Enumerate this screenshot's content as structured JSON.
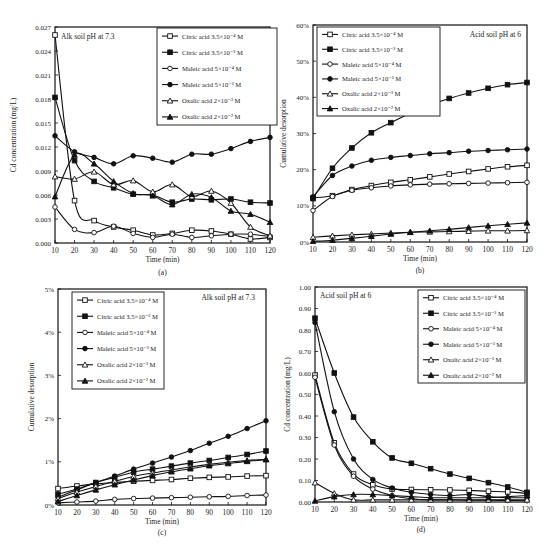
{
  "figure": {
    "panel_labels": [
      "(a)",
      "(b)",
      "(c)",
      "(d)"
    ]
  },
  "legend_entries": [
    {
      "label": "Citric acid 3.5×10⁻⁴ M",
      "marker": "square",
      "fill": "open"
    },
    {
      "label": "Citric acid 3.5×10⁻³ M",
      "marker": "square",
      "fill": "filled"
    },
    {
      "label": "Maleic acid 5×10⁻⁴ M",
      "marker": "circle",
      "fill": "open"
    },
    {
      "label": "Maleic acid 5×10⁻³ M",
      "marker": "circle",
      "fill": "filled"
    },
    {
      "label": "Oxalic acid 2×10⁻³ M",
      "marker": "triangle",
      "fill": "open"
    },
    {
      "label": "Oxalic acid 2×10⁻² M",
      "marker": "triangle",
      "fill": "filled"
    }
  ],
  "chart_data": [
    {
      "id": "a",
      "type": "line",
      "title": "Alk soil pH at 7.3",
      "panel_label": "(a)",
      "xlabel": "Time (min)",
      "ylabel": "Cd concentration (mg/L)",
      "x": [
        10,
        20,
        30,
        40,
        50,
        60,
        70,
        80,
        90,
        100,
        110,
        120
      ],
      "xlim": [
        10,
        120
      ],
      "ylim": [
        0,
        0.027
      ],
      "yticks": [
        0.0,
        0.003,
        0.006,
        0.009,
        0.012,
        0.015,
        0.018,
        0.021,
        0.024,
        0.027
      ],
      "ytick_labels": [
        "0.000",
        "0.003",
        "0.006",
        "0.009",
        "0.012",
        "0.015",
        "0.018",
        "0.021",
        "0.024",
        "0.027"
      ],
      "legend_position": "upper right",
      "grid": false,
      "series": [
        {
          "name": "Citric acid 3.5×10⁻⁴ M",
          "values": [
            0.026,
            0.0053,
            0.0028,
            0.002,
            0.0016,
            0.001,
            0.0012,
            0.0016,
            0.0015,
            0.0011,
            0.0005,
            0.0007
          ]
        },
        {
          "name": "Citric acid 3.5×10⁻³ M",
          "values": [
            0.0182,
            0.0103,
            0.0077,
            0.0069,
            0.0061,
            0.006,
            0.0051,
            0.0055,
            0.0054,
            0.0055,
            0.0051,
            0.005
          ]
        },
        {
          "name": "Maleic acid 5×10⁻⁴ M",
          "values": [
            0.0045,
            0.0017,
            0.0013,
            0.0021,
            0.0012,
            0.0007,
            0.0011,
            0.0007,
            0.0009,
            0.0011,
            0.0011,
            0.0008
          ]
        },
        {
          "name": "Maleic acid 5×10⁻³ M",
          "values": [
            0.0134,
            0.0114,
            0.0107,
            0.0099,
            0.0109,
            0.0106,
            0.0101,
            0.0111,
            0.0111,
            0.0118,
            0.0127,
            0.0132
          ]
        },
        {
          "name": "Oxalic acid 2×10⁻³ M",
          "values": [
            0.0083,
            0.008,
            0.0089,
            0.0073,
            0.0078,
            0.0064,
            0.0073,
            0.0058,
            0.0065,
            0.005,
            0.002,
            0.0009
          ]
        },
        {
          "name": "Oxalic acid 2×10⁻² M",
          "values": [
            0.0058,
            0.011,
            0.0099,
            0.0077,
            0.0062,
            0.0059,
            0.0048,
            0.0061,
            0.0057,
            0.004,
            0.0036,
            0.0026
          ]
        }
      ]
    },
    {
      "id": "b",
      "type": "line",
      "title": "Acid soil pH at 6",
      "panel_label": "(b)",
      "xlabel": "Time (min)",
      "ylabel": "Cumulative desorption",
      "x": [
        10,
        20,
        30,
        40,
        50,
        60,
        70,
        80,
        90,
        100,
        110,
        120
      ],
      "xlim": [
        10,
        120
      ],
      "ylim": [
        0,
        0.6
      ],
      "yticks": [
        0,
        0.1,
        0.2,
        0.3,
        0.4,
        0.5,
        0.6
      ],
      "ytick_labels": [
        "0%",
        "10%",
        "20%",
        "30%",
        "40%",
        "50%",
        "60%"
      ],
      "legend_position": "upper left",
      "grid": false,
      "series": [
        {
          "name": "Citric acid 3.5×10⁻⁴ M",
          "values": [
            0.122,
            0.128,
            0.145,
            0.156,
            0.165,
            0.172,
            0.18,
            0.188,
            0.195,
            0.202,
            0.208,
            0.212
          ]
        },
        {
          "name": "Citric acid 3.5×10⁻³ M",
          "values": [
            0.12,
            0.204,
            0.26,
            0.302,
            0.33,
            0.357,
            0.379,
            0.397,
            0.412,
            0.425,
            0.435,
            0.441
          ]
        },
        {
          "name": "Maleic acid 5×10⁻⁴ M",
          "values": [
            0.087,
            0.126,
            0.143,
            0.15,
            0.155,
            0.158,
            0.16,
            0.161,
            0.162,
            0.163,
            0.164,
            0.165
          ]
        },
        {
          "name": "Maleic acid 5×10⁻³ M",
          "values": [
            0.125,
            0.184,
            0.21,
            0.226,
            0.234,
            0.239,
            0.244,
            0.247,
            0.251,
            0.253,
            0.255,
            0.257
          ]
        },
        {
          "name": "Oxalic acid 2×10⁻³ M",
          "values": [
            0.013,
            0.017,
            0.02,
            0.022,
            0.025,
            0.027,
            0.028,
            0.029,
            0.03,
            0.031,
            0.031,
            0.032
          ]
        },
        {
          "name": "Oxalic acid 2×10⁻² M",
          "values": [
            0.002,
            0.005,
            0.01,
            0.016,
            0.022,
            0.027,
            0.031,
            0.035,
            0.04,
            0.045,
            0.049,
            0.053
          ]
        }
      ]
    },
    {
      "id": "c",
      "type": "line",
      "title": "Alk soil pH at 7.3",
      "panel_label": "(c)",
      "xlabel": "Time (min)",
      "ylabel": "Cumulative desorption",
      "x": [
        10,
        20,
        30,
        40,
        50,
        60,
        70,
        80,
        90,
        100,
        110,
        120
      ],
      "xlim": [
        10,
        120
      ],
      "ylim": [
        0,
        0.05
      ],
      "yticks": [
        0,
        0.01,
        0.02,
        0.03,
        0.04,
        0.05
      ],
      "ytick_labels": [
        "0%",
        "1%",
        "2%",
        "3%",
        "4%",
        "5%"
      ],
      "legend_position": "upper left",
      "grid": false,
      "series": [
        {
          "name": "Citric acid 3.5×10⁻⁴ M",
          "values": [
            0.0038,
            0.0044,
            0.0049,
            0.0052,
            0.0055,
            0.0057,
            0.0059,
            0.0062,
            0.0064,
            0.0065,
            0.0067,
            0.0068
          ]
        },
        {
          "name": "Citric acid 3.5×10⁻³ M",
          "values": [
            0.0025,
            0.0037,
            0.0052,
            0.0064,
            0.0076,
            0.0083,
            0.009,
            0.0097,
            0.0103,
            0.011,
            0.0117,
            0.0125
          ]
        },
        {
          "name": "Maleic acid 5×10⁻⁴ M",
          "values": [
            0.0005,
            0.0007,
            0.0009,
            0.0013,
            0.0015,
            0.0016,
            0.0017,
            0.0018,
            0.0019,
            0.002,
            0.0022,
            0.0023
          ]
        },
        {
          "name": "Maleic acid 5×10⁻³ M",
          "values": [
            0.0018,
            0.0035,
            0.0052,
            0.0067,
            0.0083,
            0.0097,
            0.0111,
            0.0126,
            0.0143,
            0.0159,
            0.0177,
            0.0195
          ]
        },
        {
          "name": "Oxalic acid 2×10⁻³ M",
          "values": [
            0.0015,
            0.003,
            0.0043,
            0.0055,
            0.0066,
            0.0074,
            0.0081,
            0.0088,
            0.0094,
            0.0099,
            0.0103,
            0.0106
          ]
        },
        {
          "name": "Oxalic acid 2×10⁻² M",
          "values": [
            0.0008,
            0.0022,
            0.0035,
            0.0047,
            0.0058,
            0.0068,
            0.0077,
            0.0084,
            0.0091,
            0.0096,
            0.0101,
            0.0105
          ]
        }
      ]
    },
    {
      "id": "d",
      "type": "line",
      "title": "Acid soil pH at 6",
      "panel_label": "(d)",
      "xlabel": "Time (min)",
      "ylabel": "Cd concentration (mg/L)",
      "x": [
        10,
        20,
        30,
        40,
        50,
        60,
        70,
        80,
        90,
        100,
        110,
        120
      ],
      "xlim": [
        10,
        120
      ],
      "ylim": [
        0,
        1.0
      ],
      "yticks": [
        0,
        0.1,
        0.2,
        0.3,
        0.4,
        0.5,
        0.6,
        0.7,
        0.8,
        0.9,
        1.0
      ],
      "ytick_labels": [
        "0.00",
        "0.10",
        "0.20",
        "0.30",
        "0.40",
        "0.50",
        "0.60",
        "0.70",
        "0.80",
        "0.90",
        "1.00"
      ],
      "legend_position": "upper right",
      "grid": false,
      "series": [
        {
          "name": "Citric acid 3.5×10⁻⁴ M",
          "values": [
            0.59,
            0.275,
            0.13,
            0.08,
            0.06,
            0.058,
            0.057,
            0.056,
            0.054,
            0.05,
            0.047,
            0.04
          ]
        },
        {
          "name": "Citric acid 3.5×10⁻³ M",
          "values": [
            0.855,
            0.6,
            0.395,
            0.28,
            0.205,
            0.18,
            0.155,
            0.13,
            0.11,
            0.09,
            0.07,
            0.045
          ]
        },
        {
          "name": "Maleic acid 5×10⁻⁴ M",
          "values": [
            0.58,
            0.265,
            0.12,
            0.06,
            0.03,
            0.015,
            0.01,
            0.01,
            0.008,
            0.008,
            0.007,
            0.006
          ]
        },
        {
          "name": "Maleic acid 5×10⁻³ M",
          "values": [
            0.835,
            0.42,
            0.2,
            0.105,
            0.065,
            0.045,
            0.035,
            0.03,
            0.035,
            0.025,
            0.02,
            0.02
          ]
        },
        {
          "name": "Oxalic acid 2×10⁻³ M",
          "values": [
            0.09,
            0.04,
            0.01,
            0.01,
            0.01,
            0.01,
            0.01,
            0.01,
            0.01,
            0.01,
            0.01,
            0.01
          ]
        },
        {
          "name": "Oxalic acid 2×10⁻² M",
          "values": [
            0.005,
            0.025,
            0.035,
            0.035,
            0.03,
            0.025,
            0.02,
            0.02,
            0.02,
            0.02,
            0.025,
            0.03
          ]
        }
      ]
    }
  ]
}
